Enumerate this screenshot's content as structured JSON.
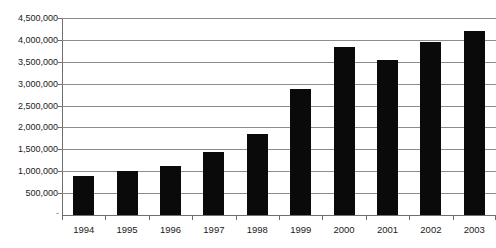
{
  "chart_data": {
    "type": "bar",
    "title": "",
    "xlabel": "",
    "ylabel": "",
    "categories": [
      "1994",
      "1995",
      "1996",
      "1997",
      "1998",
      "1999",
      "2000",
      "2001",
      "2002",
      "2003"
    ],
    "values": [
      890000,
      1000000,
      1110000,
      1450000,
      1850000,
      2880000,
      3830000,
      3550000,
      3950000,
      4200000
    ],
    "series": [
      {
        "name": "",
        "values": [
          890000,
          1000000,
          1110000,
          1450000,
          1850000,
          2880000,
          3830000,
          3550000,
          3950000,
          4200000
        ]
      }
    ],
    "ylim": [
      0,
      4500000
    ],
    "ytick_values": [
      0,
      500000,
      1000000,
      1500000,
      2000000,
      2500000,
      3000000,
      3500000,
      4000000,
      4500000
    ],
    "ytick_labels": [
      "-",
      "500,000",
      "1,000,000",
      "1,500,000",
      "2,000,000",
      "2,500,000",
      "3,000,000",
      "3,500,000",
      "4,000,000",
      "4,500,000"
    ],
    "grid": true,
    "legend": false,
    "legend_position": "none",
    "bar_color": "#0a0a0a",
    "gridline_color": "#8c8c8c",
    "axis_color": "#6e6e6e",
    "background_color": "#ffffff",
    "text_color": "#1a1a1a"
  }
}
